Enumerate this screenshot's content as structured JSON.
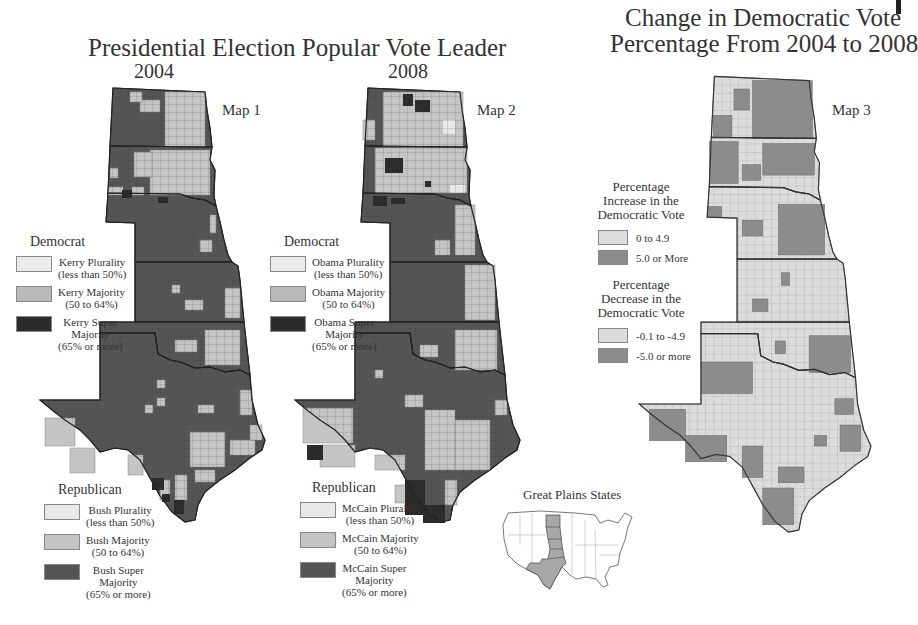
{
  "header": {
    "main_title": "Presidential Election Popular Vote Leader",
    "year_2004": "2004",
    "year_2008": "2008",
    "change_title_line1": "Change in Democratic Vote",
    "change_title_line2": "Percentage From 2004 to 2008"
  },
  "maps": [
    {
      "label": "Map 1",
      "year": "2004",
      "democrat_legend": {
        "heading": "Democrat",
        "items": [
          {
            "line1": "Kerry Plurality",
            "line2": "(less than 50%)",
            "line3": "",
            "color": "#ebebeb"
          },
          {
            "line1": "Kerry Majority",
            "line2": "(50 to 64%)",
            "line3": "",
            "color": "#b9b9b9"
          },
          {
            "line1": "Kerry Super",
            "line2": "Majority",
            "line3": "(65% or more)",
            "color": "#2b2b2b"
          }
        ]
      },
      "republican_legend": {
        "heading": "Republican",
        "items": [
          {
            "line1": "Bush Plurality",
            "line2": "(less than 50%)",
            "line3": "",
            "color": "#e8e8e8"
          },
          {
            "line1": "Bush Majority",
            "line2": "(50 to 64%)",
            "line3": "",
            "color": "#c4c4c4"
          },
          {
            "line1": "Bush Super",
            "line2": "Majority",
            "line3": "(65% or more)",
            "color": "#555555"
          }
        ]
      }
    },
    {
      "label": "Map 2",
      "year": "2008",
      "democrat_legend": {
        "heading": "Democrat",
        "items": [
          {
            "line1": "Obama Plurality",
            "line2": "(less than 50%)",
            "line3": "",
            "color": "#ebebeb"
          },
          {
            "line1": "Obama Majority",
            "line2": "(50 to 64%)",
            "line3": "",
            "color": "#b9b9b9"
          },
          {
            "line1": "Obama Super",
            "line2": "Majority",
            "line3": "(65% or more)",
            "color": "#2b2b2b"
          }
        ]
      },
      "republican_legend": {
        "heading": "Republican",
        "items": [
          {
            "line1": "McCain Plurality",
            "line2": "(less than 50%)",
            "line3": "",
            "color": "#e8e8e8"
          },
          {
            "line1": "McCain Majority",
            "line2": "(50 to 64%)",
            "line3": "",
            "color": "#c4c4c4"
          },
          {
            "line1": "McCain Super",
            "line2": "Majority",
            "line3": "(65% or more)",
            "color": "#555555"
          }
        ]
      }
    },
    {
      "label": "Map 3",
      "increase_legend": {
        "heading_line1": "Percentage",
        "heading_line2": "Increase in the",
        "heading_line3": "Democratic Vote",
        "items": [
          {
            "label": "0 to 4.9",
            "color": "#dcdcdc"
          },
          {
            "label": "5.0 or More",
            "color": "#8c8c8c"
          }
        ]
      },
      "decrease_legend": {
        "heading_line1": "Percentage",
        "heading_line2": "Decrease in the",
        "heading_line3": "Democratic Vote",
        "items": [
          {
            "label": "-0.1 to -4.9",
            "color": "#dcdcdc"
          },
          {
            "label": "-5.0 or more",
            "color": "#8c8c8c"
          }
        ]
      }
    }
  ],
  "inset": {
    "title": "Great Plains States",
    "highlighted_states": [
      "North Dakota",
      "South Dakota",
      "Nebraska",
      "Kansas",
      "Oklahoma",
      "Texas"
    ],
    "highlight_color": "#a8a8a8"
  },
  "regions": {
    "states": [
      "North Dakota",
      "South Dakota",
      "Nebraska",
      "Kansas",
      "Oklahoma",
      "Texas"
    ]
  }
}
